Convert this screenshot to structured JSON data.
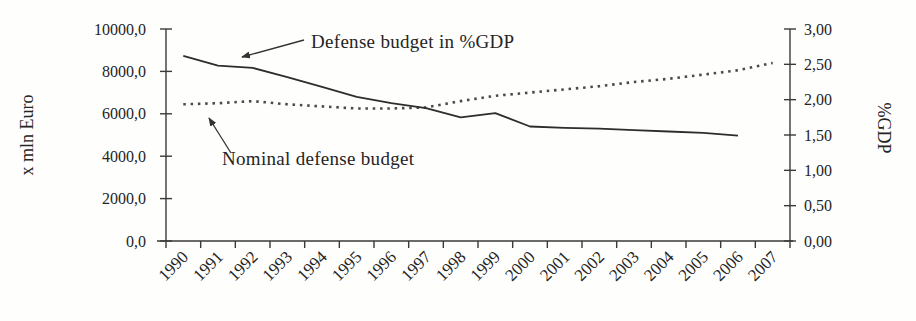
{
  "figure": {
    "background": "#fefefd",
    "text_color": "#242424",
    "axis_color": "#3a3a3a"
  },
  "chart_data": {
    "type": "line",
    "title": "",
    "x": [
      "1990",
      "1991",
      "1992",
      "1993",
      "1994",
      "1995",
      "1996",
      "1997",
      "1998",
      "1999",
      "2000",
      "2001",
      "2002",
      "2003",
      "2004",
      "2005",
      "2006",
      "2007"
    ],
    "series": [
      {
        "name": "Nominal defense budget",
        "axis": "left",
        "style": "dotted",
        "color": "#4a4a4a",
        "values": [
          6450,
          6500,
          6600,
          6450,
          6350,
          6250,
          6250,
          6300,
          6600,
          6850,
          7000,
          7150,
          7300,
          7500,
          7650,
          7850,
          8050,
          8400
        ]
      },
      {
        "name": "Defense budget in %GDP",
        "axis": "right",
        "style": "solid",
        "color": "#2d2d2d",
        "values": [
          2.62,
          2.48,
          2.45,
          2.32,
          2.18,
          2.04,
          1.95,
          1.88,
          1.75,
          1.81,
          1.62,
          1.6,
          1.59,
          1.57,
          1.55,
          1.53,
          1.49,
          null
        ]
      }
    ],
    "left_axis": {
      "label": "x mln Euro",
      "min": 0,
      "max": 10000,
      "step": 2000,
      "tick_labels": [
        "0,0",
        "2000,0",
        "4000,0",
        "6000,0",
        "8000,0",
        "10000,0"
      ]
    },
    "right_axis": {
      "label": "%GDP",
      "min": 0,
      "max": 3,
      "step": 0.5,
      "tick_labels": [
        "0,00",
        "0,50",
        "1,00",
        "1,50",
        "2,00",
        "2,50",
        "3,00"
      ]
    },
    "grid": false,
    "legend": "none",
    "annotations": [
      {
        "text": "Defense budget in %GDP",
        "points_to": "solid-line"
      },
      {
        "text": "Nominal defense budget",
        "points_to": "dotted-line"
      }
    ]
  }
}
